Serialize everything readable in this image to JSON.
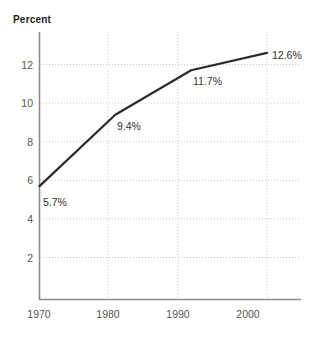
{
  "chart_data": {
    "type": "line",
    "title": "",
    "xlabel": "",
    "ylabel": "Percent",
    "x": [
      1970,
      1980,
      1990,
      2000
    ],
    "categories": [
      "1970",
      "1980",
      "1990",
      "2000"
    ],
    "values": [
      5.7,
      9.4,
      11.7,
      12.6
    ],
    "point_labels": [
      "5.7%",
      "9.4%",
      "11.7%",
      "12.6%"
    ],
    "xlim": [
      1970,
      2005
    ],
    "ylim": [
      0,
      13.6
    ],
    "yticks": [
      2,
      4,
      6,
      8,
      10,
      12
    ],
    "ytick_labels": [
      "2",
      "4",
      "6",
      "8",
      "10",
      "12"
    ],
    "xticks": [
      1970,
      1980,
      1990,
      2000
    ],
    "xtick_labels": [
      "1970",
      "1980",
      "1990",
      "2000"
    ],
    "grid": true,
    "grid_style": "dotted",
    "legend": null,
    "series": [
      {
        "name": "Percent",
        "values": [
          5.7,
          9.4,
          11.7,
          12.6
        ]
      }
    ],
    "colors": {
      "line": "#2b2b2b",
      "grid": "#c8c8c8",
      "axis": "#8c8c8c",
      "tick_text": "#555555",
      "label_text": "#333333",
      "axis_title_text": "#1a1a1a",
      "background": "#ffffff"
    }
  },
  "axis_title": {
    "text": "Percent"
  },
  "y_axis": {
    "ticks": [
      {
        "label": "12"
      },
      {
        "label": "10"
      },
      {
        "label": "8"
      },
      {
        "label": "6"
      },
      {
        "label": "4"
      },
      {
        "label": "2"
      }
    ]
  },
  "x_axis": {
    "ticks": [
      {
        "label": "1970"
      },
      {
        "label": "1980"
      },
      {
        "label": "1990"
      },
      {
        "label": "2000"
      }
    ]
  },
  "data_labels": [
    {
      "text": "5.7%"
    },
    {
      "text": "9.4%"
    },
    {
      "text": "11.7%"
    },
    {
      "text": "12.6%"
    }
  ]
}
